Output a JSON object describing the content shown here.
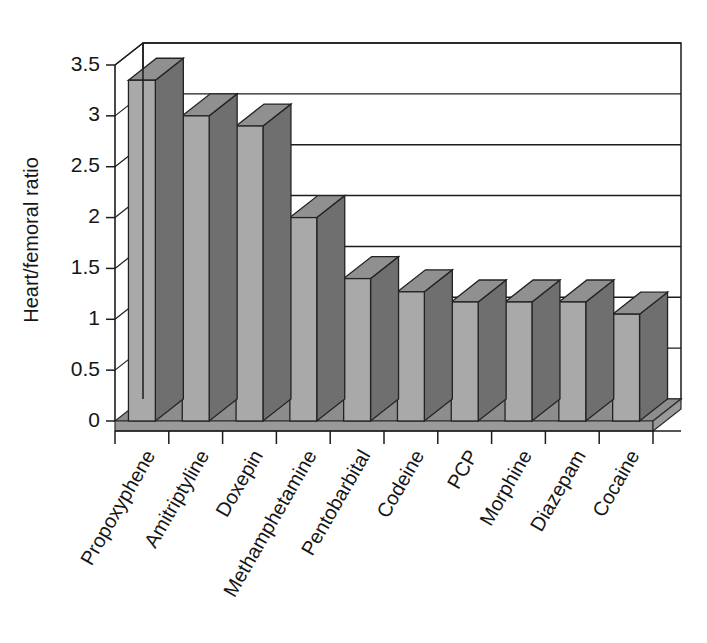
{
  "chart_data": {
    "type": "bar",
    "title": "",
    "subtitle": "",
    "xlabel": "",
    "ylabel": "Heart/femoral ratio",
    "categories": [
      "Propoxyphene",
      "Amitriptyline",
      "Doxepin",
      "Methamphetamine",
      "Pentobarbital",
      "Codeine",
      "PCP",
      "Morphine",
      "Diazepam",
      "Cocaine"
    ],
    "values": [
      3.35,
      3.0,
      2.9,
      2.0,
      1.4,
      1.27,
      1.17,
      1.17,
      1.17,
      1.05
    ],
    "ylim": [
      0,
      3.5
    ],
    "ytick_labels": [
      "0",
      "0.5",
      "1",
      "1.5",
      "2",
      "2.5",
      "3",
      "3.5"
    ],
    "ytick_values": [
      0,
      0.5,
      1,
      1.5,
      2,
      2.5,
      3,
      3.5
    ],
    "grid": true,
    "grid_axis": "y",
    "legend": false,
    "legend_position": "none",
    "style": "3d-columns",
    "colors": {
      "bar_front": "#a9a9a9",
      "bar_side": "#6f6f6f",
      "bar_top": "#909090",
      "floor": "#8d8d8d",
      "wall": "#ffffff",
      "axis": "#1c1c1c",
      "text": "#161616",
      "background": "#ffffff"
    }
  }
}
